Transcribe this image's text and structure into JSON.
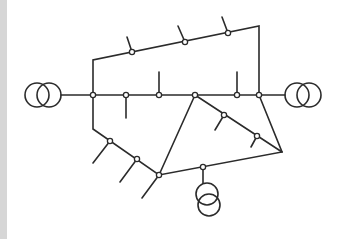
{
  "diagram": {
    "type": "single-line power network",
    "colors": {
      "line": "#2b2b2b",
      "background": "#ffffff",
      "edge_strip": "#d6d6d6"
    },
    "transformers": [
      {
        "id": "left",
        "circles": [
          [
            37,
            95
          ],
          [
            49,
            95
          ]
        ],
        "r": 12
      },
      {
        "id": "right",
        "circles": [
          [
            297,
            95
          ],
          [
            309,
            95
          ]
        ],
        "r": 12
      },
      {
        "id": "bottom",
        "circles": [
          [
            207,
            194
          ],
          [
            209,
            205
          ]
        ],
        "r": 11
      }
    ],
    "nodes": [
      [
        93,
        95
      ],
      [
        126,
        95
      ],
      [
        159,
        95
      ],
      [
        195,
        95
      ],
      [
        237,
        95
      ],
      [
        259,
        95
      ],
      [
        132,
        52
      ],
      [
        185,
        42
      ],
      [
        228,
        33
      ],
      [
        224,
        115
      ],
      [
        257,
        136
      ],
      [
        110,
        141
      ],
      [
        137,
        159
      ],
      [
        159,
        175
      ],
      [
        203,
        167
      ]
    ],
    "lines": [
      [
        [
          61,
          95
        ],
        [
          285,
          95
        ]
      ],
      [
        [
          93,
          95
        ],
        [
          93,
          60
        ],
        [
          259,
          26
        ],
        [
          259,
          95
        ]
      ],
      [
        [
          93,
          95
        ],
        [
          93,
          129
        ],
        [
          159,
          175
        ],
        [
          282,
          152
        ],
        [
          259,
          95
        ]
      ],
      [
        [
          195,
          95
        ],
        [
          282,
          152
        ]
      ],
      [
        [
          195,
          95
        ],
        [
          159,
          175
        ]
      ],
      [
        [
          203,
          167
        ],
        [
          203,
          183
        ]
      ]
    ],
    "stubs": [
      [
        [
          132,
          52
        ],
        [
          127,
          37
        ]
      ],
      [
        [
          185,
          42
        ],
        [
          178,
          26
        ]
      ],
      [
        [
          228,
          33
        ],
        [
          222,
          17
        ]
      ],
      [
        [
          126,
          95
        ],
        [
          126,
          118
        ]
      ],
      [
        [
          159,
          95
        ],
        [
          159,
          72
        ]
      ],
      [
        [
          237,
          95
        ],
        [
          237,
          72
        ]
      ],
      [
        [
          224,
          115
        ],
        [
          215,
          130
        ]
      ],
      [
        [
          257,
          136
        ],
        [
          251,
          147
        ]
      ],
      [
        [
          110,
          141
        ],
        [
          93,
          163
        ]
      ],
      [
        [
          137,
          159
        ],
        [
          120,
          182
        ]
      ],
      [
        [
          159,
          175
        ],
        [
          142,
          198
        ]
      ]
    ]
  }
}
